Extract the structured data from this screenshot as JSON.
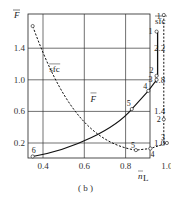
{
  "caption": "( b )",
  "chart_data": {
    "type": "line",
    "title": "",
    "xlabel": "n̄L",
    "ylabel_left": "F̄",
    "ylabel_right": "sfc (overlined)",
    "x_ticks": [
      0.4,
      0.6,
      0.8,
      1.0
    ],
    "y_left_ticks": [
      0.2,
      0.6,
      1.0,
      1.4
    ],
    "y_right_ticks": [
      1.0,
      1.4,
      1.8,
      2.2
    ],
    "xlim": [
      0.33,
      1.0
    ],
    "ylim_left": [
      0.0,
      1.83
    ],
    "ylim_right": [
      0.8,
      2.63
    ],
    "grid": true,
    "series": [
      {
        "name": "F̄",
        "style": "solid",
        "axis": "left",
        "points": [
          {
            "label": "6",
            "x": 0.35,
            "y": 0.03
          },
          {
            "label": "5",
            "x": 0.83,
            "y": 0.63
          },
          {
            "label": "4",
            "x": 0.91,
            "y": 0.86
          },
          {
            "label": "3",
            "x": 0.95,
            "y": 1.0
          },
          {
            "label": "2",
            "x": 0.95,
            "y": 1.05
          },
          {
            "label": "1",
            "x": 0.95,
            "y": 1.61
          }
        ]
      },
      {
        "name": "sfc",
        "style": "dashed",
        "axis": "right",
        "points": [
          {
            "label": "",
            "x": 0.35,
            "y": 2.48
          },
          {
            "label": "",
            "x": 0.6,
            "y": 1.2
          },
          {
            "label": "5",
            "x": 0.85,
            "y": 0.91
          },
          {
            "label": "4",
            "x": 0.92,
            "y": 0.93
          },
          {
            "label": "3",
            "x": 1.0,
            "y": 1.0
          },
          {
            "label": "2",
            "x": 0.98,
            "y": 1.3
          },
          {
            "label": "1",
            "x": 0.98,
            "y": 2.62
          }
        ]
      }
    ],
    "annotations": [
      "F̄",
      "sfc",
      "( b )"
    ]
  },
  "labels": {
    "y_left": "F",
    "y_right": "sfc",
    "x": "n",
    "x_sub": "L",
    "curve_F": "F",
    "curve_sfc": "sfc"
  }
}
